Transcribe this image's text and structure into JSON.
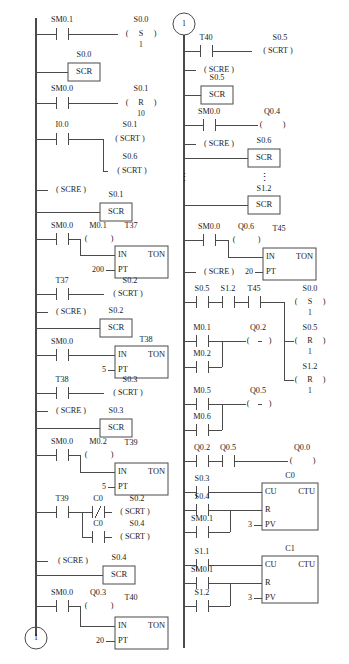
{
  "diagram": {
    "type": "ladder-logic",
    "columns": 2,
    "line_color": "#4a4a4a",
    "background_color": "#ffffff"
  },
  "connectors": {
    "left_bottom": "1",
    "right_top": "1"
  },
  "ellipsis": {
    "left": "⋮",
    "right": "⋮"
  },
  "left_column": {
    "rungs": [
      {
        "id": "L1",
        "contacts": [
          {
            "label": "SM0.1",
            "type": "NO"
          }
        ],
        "output": {
          "label": "S0.0",
          "type": "set-coil",
          "symbol": "S",
          "value": "1"
        }
      },
      {
        "id": "L2",
        "scr_box": {
          "label": "S0.0",
          "text": "SCR"
        }
      },
      {
        "id": "L3",
        "contacts": [
          {
            "label": "SM0.0",
            "type": "NO"
          }
        ],
        "output": {
          "label": "S0.1",
          "type": "reset-coil",
          "symbol": "R",
          "value": "10"
        }
      },
      {
        "id": "L4",
        "contacts": [
          {
            "label": "I0.0",
            "type": "NO"
          }
        ],
        "outputs": [
          {
            "label": "S0.1",
            "type": "scrt",
            "text": "( SCRT )"
          },
          {
            "label": "S0.6",
            "type": "scrt",
            "text": "( SCRT )"
          }
        ]
      },
      {
        "id": "L5",
        "scre": {
          "text": "( SCRE )"
        }
      },
      {
        "id": "L6",
        "scr_box": {
          "label": "S0.1",
          "text": "SCR"
        }
      },
      {
        "id": "L7",
        "contacts": [
          {
            "label": "SM0.0",
            "type": "NO"
          }
        ],
        "coil": {
          "label": "M0.1",
          "type": "coil"
        },
        "timer": {
          "label": "T37",
          "kind": "TON",
          "in": "IN",
          "pt": "PT",
          "pt_value": "200"
        }
      },
      {
        "id": "L8",
        "contacts": [
          {
            "label": "T37",
            "type": "NO"
          }
        ],
        "output": {
          "label": "S0.2",
          "type": "scrt",
          "text": "( SCRT )"
        }
      },
      {
        "id": "L9",
        "scre": {
          "text": "( SCRE )"
        }
      },
      {
        "id": "L10",
        "scr_box": {
          "label": "S0.2",
          "text": "SCR"
        }
      },
      {
        "id": "L11",
        "contacts": [
          {
            "label": "SM0.0",
            "type": "NO"
          }
        ],
        "timer": {
          "label": "T38",
          "kind": "TON",
          "in": "IN",
          "pt": "PT",
          "pt_value": "5"
        }
      },
      {
        "id": "L12",
        "contacts": [
          {
            "label": "T38",
            "type": "NO"
          }
        ],
        "output": {
          "label": "S0.3",
          "type": "scrt",
          "text": "( SCRT )"
        }
      },
      {
        "id": "L13",
        "scre": {
          "text": "( SCRE )"
        }
      },
      {
        "id": "L14",
        "scr_box": {
          "label": "S0.3",
          "text": "SCR"
        }
      },
      {
        "id": "L15",
        "contacts": [
          {
            "label": "SM0.0",
            "type": "NO"
          }
        ],
        "coil": {
          "label": "M0.2",
          "type": "coil"
        },
        "timer": {
          "label": "T39",
          "kind": "TON",
          "in": "IN",
          "pt": "PT",
          "pt_value": "5"
        }
      },
      {
        "id": "L16",
        "contacts": [
          {
            "label": "T39",
            "type": "NO"
          }
        ],
        "branches": [
          {
            "contact": {
              "label": "C0",
              "type": "NC"
            },
            "output": {
              "label": "S0.2",
              "type": "scrt",
              "text": "( SCRT )"
            }
          },
          {
            "contact": {
              "label": "C0",
              "type": "NO"
            },
            "output": {
              "label": "S0.4",
              "type": "scrt",
              "text": "( SCRT )"
            }
          }
        ]
      },
      {
        "id": "L17",
        "scre": {
          "text": "( SCRE )"
        },
        "scr_box": {
          "label": "S0.4",
          "text": "SCR"
        }
      },
      {
        "id": "L18",
        "contacts": [
          {
            "label": "SM0.0",
            "type": "NO"
          }
        ],
        "coil": {
          "label": "Q0.3",
          "type": "coil"
        },
        "timer": {
          "label": "T40",
          "kind": "TON",
          "in": "IN",
          "pt": "PT",
          "pt_value": "20"
        }
      }
    ]
  },
  "right_column": {
    "rungs": [
      {
        "id": "R1",
        "contacts": [
          {
            "label": "T40",
            "type": "NO"
          }
        ],
        "output": {
          "label": "S0.5",
          "type": "scrt",
          "text": "( SCRT )"
        }
      },
      {
        "id": "R2",
        "scre": {
          "text": "( SCRE )"
        }
      },
      {
        "id": "R3",
        "scr_box": {
          "label": "S0.5",
          "text": "SCR"
        }
      },
      {
        "id": "R4",
        "contacts": [
          {
            "label": "SM0.0",
            "type": "NO"
          }
        ],
        "coil": {
          "label": "Q0.4",
          "type": "coil"
        }
      },
      {
        "id": "R5",
        "scre": {
          "text": "( SCRE )"
        },
        "scr_box": {
          "label": "S0.6",
          "text": "SCR"
        }
      },
      {
        "id": "R6",
        "scr_box": {
          "label": "S1.2",
          "text": "SCR"
        }
      },
      {
        "id": "R7",
        "contacts": [
          {
            "label": "SM0.0",
            "type": "NO"
          }
        ],
        "coil": {
          "label": "Q0.6",
          "type": "coil"
        },
        "timer": {
          "label": "T45",
          "kind": "TON",
          "in": "IN",
          "pt": "PT",
          "pt_value": "20"
        }
      },
      {
        "id": "R8",
        "scre": {
          "text": "( SCRE )"
        }
      },
      {
        "id": "R9",
        "contacts": [
          {
            "label": "S0.5",
            "type": "NO"
          },
          {
            "label": "S1.2",
            "type": "NO"
          },
          {
            "label": "T45",
            "type": "NO"
          }
        ],
        "outputs": [
          {
            "label": "S0.0",
            "type": "set-coil",
            "symbol": "S",
            "value": "1"
          },
          {
            "label": "S0.5",
            "type": "reset-coil",
            "symbol": "R",
            "value": "1"
          },
          {
            "label": "S1.2",
            "type": "reset-coil",
            "symbol": "R",
            "value": "1"
          }
        ]
      },
      {
        "id": "R10",
        "contacts": [
          {
            "label": "M0.1",
            "type": "NO"
          }
        ],
        "parallel": [
          {
            "label": "M0.2",
            "type": "NO"
          }
        ],
        "coil": {
          "label": "Q0.2",
          "type": "coil"
        }
      },
      {
        "id": "R11",
        "contacts": [
          {
            "label": "M0.5",
            "type": "NO"
          }
        ],
        "parallel": [
          {
            "label": "M0.6",
            "type": "NO"
          }
        ],
        "coil": {
          "label": "Q0.5",
          "type": "coil"
        }
      },
      {
        "id": "R12",
        "contacts": [
          {
            "label": "Q0.2",
            "type": "NO"
          },
          {
            "label": "Q0.5",
            "type": "NO"
          }
        ],
        "coil": {
          "label": "Q0.0",
          "type": "coil"
        }
      },
      {
        "id": "R13",
        "counter": {
          "label": "C0",
          "kind": "CTU",
          "cu": "CU",
          "r": "R",
          "pv": "PV",
          "pv_value": "3"
        },
        "cu_contact": {
          "label": "S0.3",
          "type": "NO"
        },
        "r_contacts": [
          {
            "label": "S0.4",
            "type": "NO"
          },
          {
            "label": "SM0.1",
            "type": "NO"
          }
        ]
      },
      {
        "id": "R14",
        "counter": {
          "label": "C1",
          "kind": "CTU",
          "cu": "CU",
          "r": "R",
          "pv": "PV",
          "pv_value": "3"
        },
        "cu_contact": {
          "label": "S1.1",
          "type": "NO"
        },
        "r_contacts": [
          {
            "label": "SM0.1",
            "type": "NO"
          },
          {
            "label": "S1.2",
            "type": "NO"
          }
        ]
      }
    ]
  }
}
